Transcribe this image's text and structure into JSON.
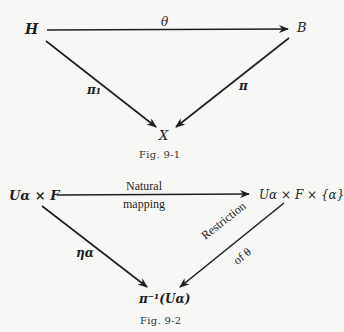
{
  "figures": [
    {
      "caption": "Fig. 9-1",
      "nodes": {
        "top_left": "H",
        "top_right": "B",
        "bottom": "X"
      },
      "arrows": {
        "top": {
          "from": "H",
          "to": "B",
          "label": "θ"
        },
        "left": {
          "from": "H",
          "to": "X",
          "label": "π₁"
        },
        "right": {
          "from": "B",
          "to": "X",
          "label": "π"
        }
      }
    },
    {
      "caption": "Fig. 9-2",
      "nodes": {
        "top_left": "Uα × F",
        "top_right": "Uα × F × {α}",
        "bottom": "π⁻¹(Uα)"
      },
      "arrows": {
        "top": {
          "from": "Uα × F",
          "to": "Uα × F × {α}",
          "label_line1": "Natural",
          "label_line2": "mapping"
        },
        "left": {
          "from": "Uα × F",
          "to": "π⁻¹(Uα)",
          "label": "ηα"
        },
        "right": {
          "from": "Uα × F × {α}",
          "to": "π⁻¹(Uα)",
          "label_line1": "Restriction",
          "label_line2": "of θ"
        }
      }
    }
  ]
}
